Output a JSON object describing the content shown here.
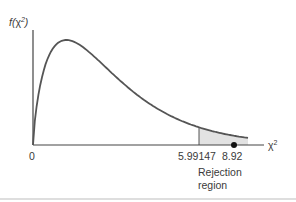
{
  "chart_data": {
    "type": "line",
    "title": "",
    "distribution": "chi-square",
    "degrees_of_freedom": 2,
    "ylabel": "f(χ²)",
    "xlabel": "χ²",
    "ylabel_parts": {
      "f": "f(",
      "chi": "χ",
      "sup": "2",
      "close": ")"
    },
    "xlabel_parts": {
      "chi": "χ",
      "sup": "2"
    },
    "tick_labels": [
      "0",
      "5.99147",
      "8.92"
    ],
    "critical_value": 5.99147,
    "test_statistic": 8.92,
    "annotation": [
      "Rejection",
      "region"
    ],
    "shaded_region": "right tail beyond critical value",
    "grid": false,
    "legend": "none"
  },
  "colors": {
    "curve": "#555555",
    "axis": "#444444",
    "shade": "#e2e2e2",
    "dot": "#111111",
    "divider": "#bdbdbd"
  }
}
